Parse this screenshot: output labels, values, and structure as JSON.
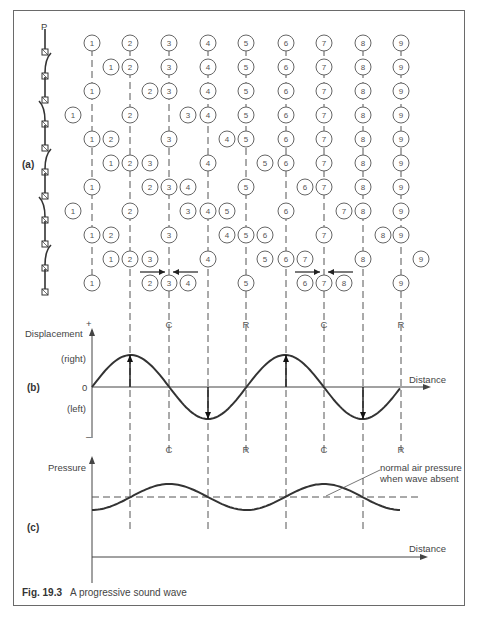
{
  "figure": {
    "caption_label": "Fig. 19.3",
    "caption_text": "A progressive sound wave"
  },
  "panel_a": {
    "label": "(a)",
    "pendulum_top_label": "P",
    "columns_x": [
      92,
      130,
      169,
      208,
      246,
      286,
      324,
      363,
      401
    ],
    "row_y": [
      43,
      67,
      91,
      115,
      139,
      163,
      187,
      211,
      235,
      259,
      283
    ],
    "pendulum_tilt": [
      0,
      1,
      0,
      -1,
      0,
      1,
      0,
      -1,
      0,
      1,
      0
    ],
    "rows": [
      [
        92,
        130,
        169,
        208,
        246,
        286,
        324,
        363,
        401
      ],
      [
        111,
        130,
        169,
        208,
        246,
        286,
        324,
        363,
        401
      ],
      [
        92,
        150,
        169,
        208,
        246,
        286,
        324,
        363,
        401
      ],
      [
        73,
        130,
        188,
        208,
        246,
        286,
        324,
        363,
        401
      ],
      [
        92,
        111,
        169,
        227,
        246,
        286,
        324,
        363,
        401
      ],
      [
        111,
        130,
        150,
        208,
        265,
        286,
        324,
        363,
        401
      ],
      [
        92,
        150,
        169,
        188,
        246,
        305,
        324,
        363,
        401
      ],
      [
        73,
        130,
        188,
        208,
        227,
        286,
        344,
        363,
        401
      ],
      [
        92,
        111,
        169,
        227,
        246,
        265,
        324,
        383,
        401
      ],
      [
        111,
        130,
        150,
        208,
        265,
        286,
        305,
        363,
        421
      ],
      [
        92,
        150,
        169,
        188,
        246,
        305,
        324,
        344,
        401
      ]
    ],
    "particle_labels": [
      "1",
      "2",
      "3",
      "4",
      "5",
      "6",
      "7",
      "8",
      "9"
    ],
    "compression_arrows": [
      {
        "from": 140,
        "to": 165,
        "y": 272
      },
      {
        "from": 198,
        "to": 173,
        "y": 272
      },
      {
        "from": 295,
        "to": 320,
        "y": 272
      },
      {
        "from": 353,
        "to": 328,
        "y": 272
      }
    ]
  },
  "panel_b": {
    "label": "(b)",
    "y_axis_label": "Displacement",
    "plus_sign": "+",
    "minus_sign": "–",
    "zero_label": "0",
    "right_label": "(right)",
    "left_label": "(left)",
    "x_axis_label": "Distance",
    "markers_top": [
      {
        "x": 169,
        "t": "C"
      },
      {
        "x": 246,
        "t": "R"
      },
      {
        "x": 324,
        "t": "C"
      },
      {
        "x": 401,
        "t": "R"
      }
    ],
    "markers_bottom": [
      {
        "x": 169,
        "t": "C"
      },
      {
        "x": 246,
        "t": "R"
      },
      {
        "x": 324,
        "t": "C"
      },
      {
        "x": 401,
        "t": "R"
      }
    ]
  },
  "panel_c": {
    "label": "(c)",
    "y_axis_label": "Pressure",
    "x_axis_label": "Distance",
    "annotation_line1": "normal air pressure",
    "annotation_line2": "when wave absent"
  },
  "chart_data": {
    "type": "line",
    "title": "A progressive sound wave",
    "series": [
      {
        "name": "Displacement",
        "x": [
          0,
          1,
          2,
          3,
          4,
          5,
          6,
          7,
          8
        ],
        "values": [
          0,
          1,
          0,
          -1,
          0,
          1,
          0,
          -1,
          0
        ]
      },
      {
        "name": "Pressure (relative to normal)",
        "x": [
          0,
          1,
          2,
          3,
          4,
          5,
          6,
          7,
          8
        ],
        "values": [
          -1,
          0,
          1,
          0,
          -1,
          0,
          1,
          0,
          -1
        ]
      }
    ],
    "xlabel": "Distance",
    "ylabel": "Displacement / Pressure",
    "annotations": [
      "C = compression",
      "R = rarefaction"
    ]
  }
}
